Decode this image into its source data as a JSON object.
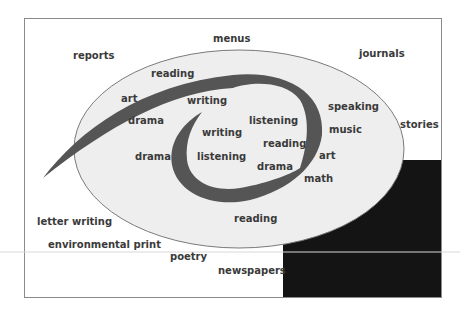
{
  "diagram": {
    "title": "",
    "colors": {
      "frame": "#8a8a8a",
      "ellipse_fill": "#eeeeee",
      "ellipse_stroke": "#7a7a7a",
      "spiral": "#555555",
      "dark_block": "#141414",
      "text": "#3a3a3a"
    },
    "outer_labels": [
      {
        "id": "menus",
        "text": "menus"
      },
      {
        "id": "reports",
        "text": "reports"
      },
      {
        "id": "journals",
        "text": "journals"
      },
      {
        "id": "stories",
        "text": "stories"
      },
      {
        "id": "letter-writing",
        "text": "letter writing"
      },
      {
        "id": "environmental-print",
        "text": "environmental print"
      },
      {
        "id": "poetry",
        "text": "poetry"
      },
      {
        "id": "newspapers",
        "text": "newspapers"
      }
    ],
    "ellipse_labels": [
      {
        "id": "reading-top",
        "text": "reading"
      },
      {
        "id": "art-left",
        "text": "art"
      },
      {
        "id": "drama-upper-left",
        "text": "drama"
      },
      {
        "id": "drama-left",
        "text": "drama"
      },
      {
        "id": "speaking",
        "text": "speaking"
      },
      {
        "id": "music",
        "text": "music"
      },
      {
        "id": "art-right",
        "text": "art"
      },
      {
        "id": "math",
        "text": "math"
      },
      {
        "id": "reading-bottom",
        "text": "reading"
      }
    ],
    "spiral_labels": [
      {
        "id": "writing-top",
        "text": "writing"
      },
      {
        "id": "writing-inner",
        "text": "writing"
      },
      {
        "id": "listening-upper",
        "text": "listening"
      },
      {
        "id": "reading-inner",
        "text": "reading"
      },
      {
        "id": "listening-inner",
        "text": "listening"
      },
      {
        "id": "drama-inner",
        "text": "drama"
      }
    ]
  }
}
